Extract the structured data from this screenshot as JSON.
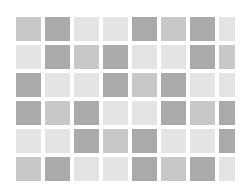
{
  "palette": {
    "light": "#e4e4e4",
    "medium": "#c8c8c8",
    "dark": "#aaaaaa",
    "background": "#ffffff"
  },
  "grid": {
    "rows": 6,
    "columns": 8,
    "cells": [
      [
        "medium",
        "dark",
        "light",
        "light",
        "dark",
        "medium",
        "dark",
        "light"
      ],
      [
        "light",
        "dark",
        "medium",
        "dark",
        "light",
        "light",
        "dark",
        "medium"
      ],
      [
        "dark",
        "light",
        "light",
        "dark",
        "medium",
        "dark",
        "light",
        "light"
      ],
      [
        "dark",
        "medium",
        "dark",
        "light",
        "light",
        "dark",
        "medium",
        "dark"
      ],
      [
        "light",
        "light",
        "dark",
        "medium",
        "dark",
        "light",
        "light",
        "dark"
      ],
      [
        "medium",
        "dark",
        "light",
        "light",
        "dark",
        "medium",
        "dark",
        "light"
      ]
    ]
  }
}
